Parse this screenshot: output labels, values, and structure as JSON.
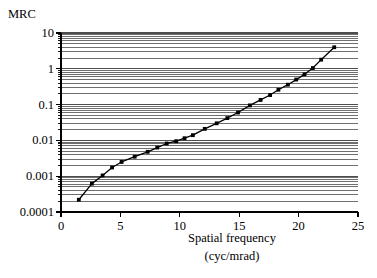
{
  "figure": {
    "background_color": "#ffffff",
    "axis_color": "#000000",
    "grid_color": "#4d4d4d",
    "series_color": "#000000"
  },
  "labels": {
    "ylabel": "MRC",
    "xlabel_line1": "Spatial frequency",
    "xlabel_line2": "(cyc/mrad)"
  },
  "chart_data": {
    "type": "line",
    "title": "",
    "xlabel": "Spatial frequency (cyc/mrad)",
    "ylabel": "MRC",
    "xscale": "linear",
    "yscale": "log",
    "xlim": [
      0,
      25
    ],
    "ylim": [
      0.0001,
      10
    ],
    "xticks": [
      0,
      5,
      10,
      15,
      20,
      25
    ],
    "xticklabels": [
      "0",
      "5",
      "10",
      "15",
      "20",
      "25"
    ],
    "yticks": [
      0.0001,
      0.001,
      0.01,
      0.1,
      1,
      10
    ],
    "yticklabels": [
      "0.0001",
      "0.001",
      "0.01",
      "0.1",
      "1",
      "10"
    ],
    "grid": "horizontal-major-and-minor",
    "legend": "none",
    "marker": "filled-square",
    "series": [
      {
        "name": "MRC",
        "x": [
          1.5,
          2.6,
          3.5,
          4.3,
          5.1,
          6.2,
          7.3,
          8.1,
          8.9,
          9.7,
          10.4,
          11.1,
          12.1,
          13.1,
          14.0,
          14.9,
          15.9,
          16.8,
          17.6,
          18.3,
          19.1,
          19.8,
          20.5,
          21.2,
          21.9,
          23.0
        ],
        "y": [
          0.00022,
          0.00062,
          0.00105,
          0.00175,
          0.0025,
          0.0035,
          0.0048,
          0.0063,
          0.0082,
          0.0095,
          0.0115,
          0.014,
          0.021,
          0.03,
          0.042,
          0.06,
          0.095,
          0.135,
          0.185,
          0.26,
          0.36,
          0.5,
          0.7,
          1.05,
          1.8,
          4.0
        ]
      }
    ]
  }
}
